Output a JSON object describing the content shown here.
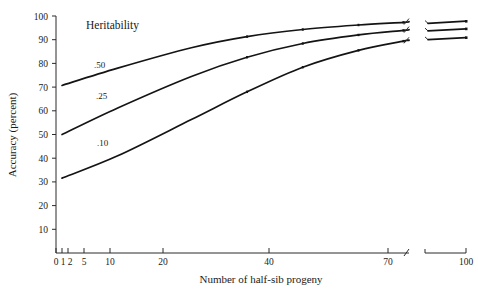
{
  "chart_data": {
    "type": "line",
    "title": "",
    "xlabel": "Number of half-sib progeny",
    "ylabel": "Accuracy (percent)",
    "legend_title": "Heritability",
    "legend_position": "inline-curve-labels",
    "grid": false,
    "x_scale": "log",
    "x_axis_break": true,
    "x_axis_break_range": [
      75,
      85
    ],
    "xlim": [
      1,
      100
    ],
    "ylim": [
      0,
      100
    ],
    "x_ticks": [
      "0",
      "1",
      "2",
      "5",
      "10",
      "20",
      "40",
      "70",
      "100"
    ],
    "x_tick_values": [
      0,
      1,
      2,
      5,
      10,
      20,
      40,
      70,
      100
    ],
    "y_ticks": [
      "10",
      "20",
      "30",
      "40",
      "50",
      "60",
      "70",
      "80",
      "90",
      "100"
    ],
    "y_tick_values": [
      10,
      20,
      30,
      40,
      50,
      60,
      70,
      80,
      90,
      100
    ],
    "x": [
      1,
      2,
      5,
      10,
      20,
      40,
      70,
      100
    ],
    "series": [
      {
        "name": ".50",
        "label": ".50",
        "heritability": 0.5,
        "values": [
          70.7,
          78.0,
          86.6,
          91.3,
          94.3,
          96.2,
          97.3,
          97.8
        ]
      },
      {
        "name": ".25",
        "label": ".25",
        "heritability": 0.25,
        "values": [
          50.0,
          61.2,
          74.5,
          82.6,
          88.4,
          92.0,
          93.9,
          94.6
        ]
      },
      {
        "name": ".10",
        "label": ".10",
        "heritability": 0.1,
        "values": [
          31.6,
          41.0,
          56.3,
          68.0,
          78.4,
          85.5,
          89.4,
          90.9
        ]
      }
    ]
  },
  "labels": {
    "legend_title": "Heritability",
    "y_axis_title": "Accuracy (percent)",
    "x_axis_title": "Number of half-sib progeny",
    "curve_050": ".50",
    "curve_025": ".25",
    "curve_010": ".10",
    "y_100": "100",
    "y_90": "90",
    "y_80": "80",
    "y_70": "70",
    "y_60": "60",
    "y_50": "50",
    "y_40": "40",
    "y_30": "30",
    "y_20": "20",
    "y_10": "10",
    "x_0": "0",
    "x_1": "1",
    "x_2": "2",
    "x_5": "5",
    "x_10": "10",
    "x_20": "20",
    "x_40": "40",
    "x_70": "70",
    "x_100": "100"
  },
  "colors": {
    "curve": "#141414",
    "axis": "#2b2b2b",
    "text": "#1a1a1a",
    "background": "#ffffff"
  }
}
